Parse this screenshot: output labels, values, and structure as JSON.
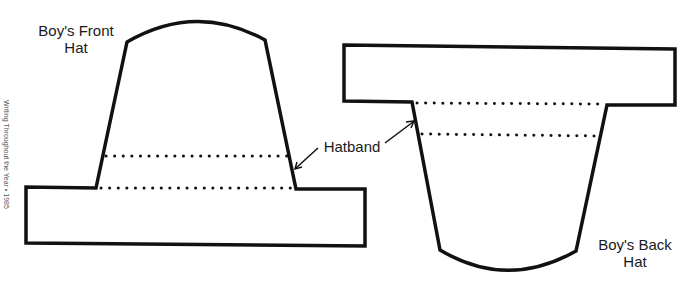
{
  "labels": {
    "front_hat_line1": "Boy's Front",
    "front_hat_line2": "Hat",
    "back_hat_line1": "Boy's Back",
    "back_hat_line2": "Hat",
    "hatband": "Hatband"
  },
  "margin_text": "Writing Throughout the Year • 1985",
  "colors": {
    "outline": "#111111",
    "background": "#ffffff"
  }
}
